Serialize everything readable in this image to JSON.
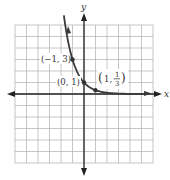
{
  "chart_data": {
    "type": "line",
    "title": "",
    "function": "y = (1/3)^x",
    "xlabel": "x",
    "ylabel": "y",
    "xlim": [
      -6,
      6
    ],
    "ylim": [
      -6,
      6
    ],
    "grid": true,
    "grid_step": 1,
    "series": [
      {
        "name": "f(x) = 3^(-x)",
        "x": [
          -1.8,
          -1.5,
          -1,
          -0.5,
          0,
          0.5,
          1,
          2,
          3,
          4,
          5,
          6
        ],
        "values": [
          7.22,
          5.2,
          3,
          1.73,
          1,
          0.577,
          0.333,
          0.111,
          0.037,
          0.012,
          0.004,
          0.001
        ]
      }
    ],
    "points": [
      {
        "x": -1,
        "y": 3,
        "label": "(−1, 3)"
      },
      {
        "x": 0,
        "y": 1,
        "label": "(0, 1)"
      },
      {
        "x": 1,
        "y": 0.3333,
        "label": "(1, 1/3)"
      }
    ]
  },
  "labels": {
    "x_axis": "x",
    "y_axis": "y",
    "p1": "(−1, 3)",
    "p2": "(0, 1)",
    "p3_open": "(1,",
    "p3_num": "1",
    "p3_den": "3",
    "p3_close": ")"
  },
  "colors": {
    "grid": "#b8b8b8",
    "axis": "#222222",
    "curve": "#3a3a3a"
  }
}
